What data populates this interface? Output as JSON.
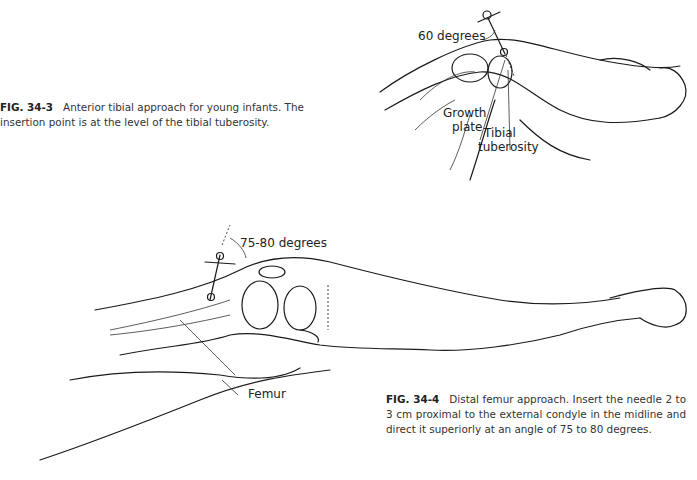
{
  "figures": [
    {
      "id": "fig-34-3",
      "number": "FIG. 34-3",
      "caption": "Anterior tibial approach for young infants. The insertion point is at the level of the tibial tuberosity.",
      "labels": {
        "angle": "60 degrees",
        "growth_plate_1": "Growth",
        "growth_plate_2": "plate",
        "tibial_1": "Tibial",
        "tibial_2": "tuberosity"
      }
    },
    {
      "id": "fig-34-4",
      "number": "FIG. 34-4",
      "caption": "Distal femur approach. Insert the needle 2 to 3 cm proximal to the external condyle in the midline and direct it superiorly at an angle of 75 to 80 degrees.",
      "labels": {
        "angle": "75-80 degrees",
        "femur": "Femur"
      }
    }
  ]
}
